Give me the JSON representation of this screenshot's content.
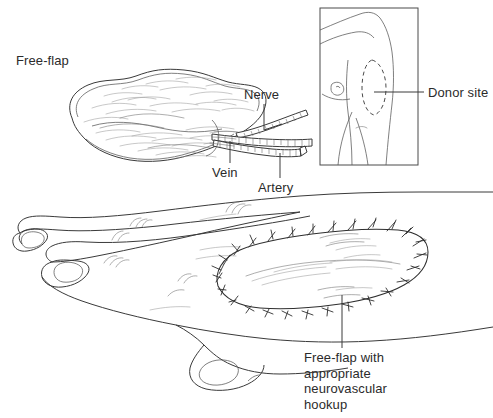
{
  "figure": {
    "background_color": "#ffffff",
    "ink_color": "#3a3a3a",
    "style": "line-art medical illustration"
  },
  "labels": {
    "free_flap": "Free-flap",
    "nerve": "Nerve",
    "vein": "Vein",
    "artery": "Artery",
    "donor_site": "Donor site",
    "caption": "Free-flap with appropriate neurovascular hookup"
  },
  "panels": {
    "flap_panel": {
      "name": "harvested free-flap with vascular pedicle",
      "label": "Free-flap",
      "structures": [
        "Nerve",
        "Vein",
        "Artery"
      ]
    },
    "donor_inset": {
      "name": "torso donor site inset",
      "label": "Donor site",
      "marking": "dashed oval on lateral chest"
    },
    "hand_panel": {
      "name": "dorsum of hand with sutured flap",
      "caption": "Free-flap with appropriate neurovascular hookup",
      "suture_count": 28
    }
  }
}
